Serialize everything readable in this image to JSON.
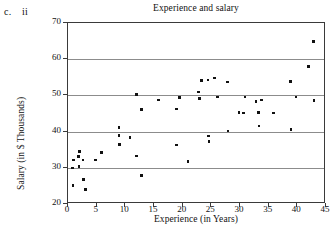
{
  "problem": {
    "letter": "c.",
    "roman": "ii"
  },
  "chart_data": {
    "type": "scatter",
    "title": "Experience and salary",
    "xlabel": "Experience (in Years)",
    "ylabel": "Salary (in $ Thousands)",
    "xlim": [
      0,
      45
    ],
    "ylim": [
      20,
      70
    ],
    "xticks": [
      0,
      5,
      10,
      15,
      20,
      25,
      30,
      35,
      40,
      45
    ],
    "yticks": [
      20,
      30,
      40,
      50,
      60,
      70
    ],
    "grid": "horizontal",
    "gridlines": [
      30,
      40,
      50,
      60
    ],
    "legend": null,
    "marker": "square",
    "marker_color": "#111111",
    "points": [
      {
        "x": 1.0,
        "y": 32.2
      },
      {
        "x": 0.8,
        "y": 30.0
      },
      {
        "x": 0.9,
        "y": 25.1
      },
      {
        "x": 1.8,
        "y": 33.2
      },
      {
        "x": 2.0,
        "y": 34.5
      },
      {
        "x": 1.9,
        "y": 30.3
      },
      {
        "x": 2.6,
        "y": 32.1
      },
      {
        "x": 2.7,
        "y": 26.8
      },
      {
        "x": 3.1,
        "y": 24.0
      },
      {
        "x": 4.8,
        "y": 32.1
      },
      {
        "x": 5.8,
        "y": 34.3
      },
      {
        "x": 8.9,
        "y": 41.2
      },
      {
        "x": 8.9,
        "y": 38.9
      },
      {
        "x": 9.0,
        "y": 36.4
      },
      {
        "x": 10.8,
        "y": 38.3
      },
      {
        "x": 11.9,
        "y": 50.2
      },
      {
        "x": 11.9,
        "y": 33.3
      },
      {
        "x": 12.8,
        "y": 46.1
      },
      {
        "x": 12.8,
        "y": 27.8
      },
      {
        "x": 15.8,
        "y": 48.7
      },
      {
        "x": 18.9,
        "y": 46.2
      },
      {
        "x": 18.9,
        "y": 36.3
      },
      {
        "x": 19.4,
        "y": 49.5
      },
      {
        "x": 20.9,
        "y": 31.7
      },
      {
        "x": 22.8,
        "y": 50.9
      },
      {
        "x": 22.9,
        "y": 49.1
      },
      {
        "x": 23.3,
        "y": 54.1
      },
      {
        "x": 24.4,
        "y": 54.2
      },
      {
        "x": 24.5,
        "y": 38.8
      },
      {
        "x": 24.6,
        "y": 37.3
      },
      {
        "x": 25.6,
        "y": 54.8
      },
      {
        "x": 26.1,
        "y": 49.6
      },
      {
        "x": 27.8,
        "y": 53.7
      },
      {
        "x": 27.9,
        "y": 40.2
      },
      {
        "x": 29.8,
        "y": 45.2
      },
      {
        "x": 30.6,
        "y": 45.1
      },
      {
        "x": 30.9,
        "y": 49.6
      },
      {
        "x": 32.8,
        "y": 48.3
      },
      {
        "x": 33.2,
        "y": 45.3
      },
      {
        "x": 33.3,
        "y": 41.5
      },
      {
        "x": 33.8,
        "y": 48.7
      },
      {
        "x": 35.8,
        "y": 45.1
      },
      {
        "x": 38.8,
        "y": 53.9
      },
      {
        "x": 38.9,
        "y": 40.6
      },
      {
        "x": 39.8,
        "y": 49.6
      },
      {
        "x": 41.9,
        "y": 58.0
      },
      {
        "x": 42.8,
        "y": 64.9
      },
      {
        "x": 42.9,
        "y": 48.6
      }
    ]
  }
}
